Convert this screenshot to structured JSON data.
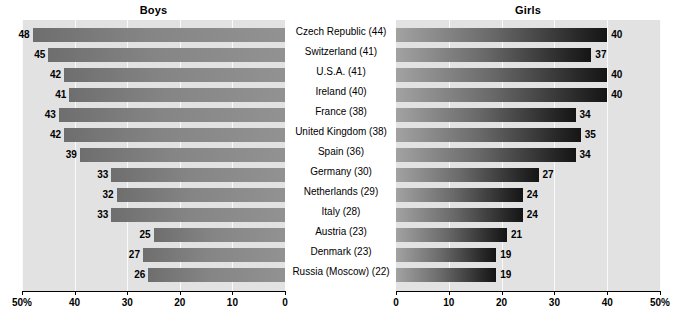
{
  "panels": {
    "left_title": "Boys",
    "right_title": "Girls"
  },
  "axis": {
    "left_ticks": [
      "50%",
      "40",
      "30",
      "20",
      "10",
      "0"
    ],
    "right_ticks": [
      "0",
      "10",
      "20",
      "30",
      "40",
      "50%"
    ],
    "max": 50,
    "min": 0
  },
  "countries": [
    "Czech Republic (44)",
    "Switzerland (41)",
    "U.S.A. (41)",
    "Ireland (40)",
    "France (38)",
    "United Kingdom (38)",
    "Spain (36)",
    "Germany (30)",
    "Netherlands (29)",
    "Italy (28)",
    "Austria (23)",
    "Denmark (23)",
    "Russia (Moscow) (22)"
  ],
  "chart_data": {
    "type": "bar",
    "title": "",
    "orientation": "horizontal",
    "layout": "back-to-back population pyramid",
    "categories": [
      "Czech Republic (44)",
      "Switzerland (41)",
      "U.S.A. (41)",
      "Ireland (40)",
      "France (38)",
      "United Kingdom (38)",
      "Spain (36)",
      "Germany (30)",
      "Netherlands (29)",
      "Italy (28)",
      "Austria (23)",
      "Denmark (23)",
      "Russia (Moscow) (22)"
    ],
    "series": [
      {
        "name": "Boys",
        "side": "left",
        "values": [
          48,
          45,
          42,
          41,
          43,
          42,
          39,
          33,
          32,
          33,
          25,
          27,
          26
        ]
      },
      {
        "name": "Girls",
        "side": "right",
        "values": [
          40,
          37,
          40,
          40,
          34,
          35,
          34,
          27,
          24,
          24,
          21,
          19,
          19
        ]
      }
    ],
    "xlabel": "",
    "ylabel": "",
    "xlim_left": [
      50,
      0
    ],
    "xlim_right": [
      0,
      50
    ],
    "xticks_left": [
      50,
      40,
      30,
      20,
      10,
      0
    ],
    "xticks_right": [
      0,
      10,
      20,
      30,
      40,
      50
    ],
    "unit": "%",
    "grid": true,
    "legend": "panel titles",
    "colors": {
      "panel_background": "#e2e2e2",
      "boys_bar": "#858585",
      "girls_bar_start": "#a2a2a2",
      "girls_bar_end": "#151515",
      "gridline": "#fafafa",
      "axis": "#000000",
      "text": "#000000"
    }
  }
}
